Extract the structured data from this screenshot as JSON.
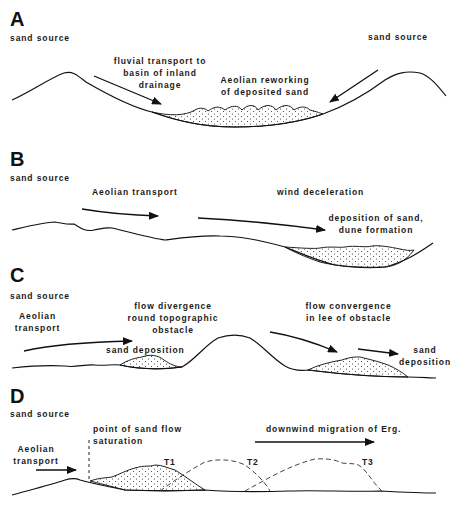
{
  "panels": {
    "A": {
      "letter": "A",
      "sand_source_left": "sand source",
      "sand_source_right": "sand source",
      "fluvial_1": "fluvial transport to",
      "fluvial_2": "basin of inland",
      "fluvial_3": "drainage",
      "aeolian_1": "Aeolian reworking",
      "aeolian_2": "of deposited sand"
    },
    "B": {
      "letter": "B",
      "sand_source": "sand source",
      "aeolian_transport": "Aeolian transport",
      "wind_deceleration": "wind deceleration",
      "deposition_1": "deposition of sand,",
      "deposition_2": "dune formation"
    },
    "C": {
      "letter": "C",
      "sand_source": "sand source",
      "aeolian_1": "Aeolian",
      "aeolian_2": "transport",
      "divergence_1": "flow divergence",
      "divergence_2": "round topographic",
      "divergence_3": "obstacle",
      "sand_deposition_left": "sand deposition",
      "convergence_1": "flow convergence",
      "convergence_2": "in lee of obstacle",
      "sand_deposition_right_1": "sand",
      "sand_deposition_right_2": "deposition"
    },
    "D": {
      "letter": "D",
      "sand_source": "sand source",
      "saturation_1": "point of sand flow",
      "saturation_2": "saturation",
      "aeolian_1": "Aeolian",
      "aeolian_2": "transport",
      "migration": "downwind migration of Erg.",
      "t1": "T1",
      "t2": "T2",
      "t3": "T3"
    }
  }
}
